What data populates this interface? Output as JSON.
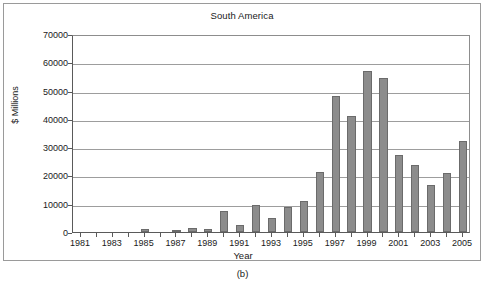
{
  "figure": {
    "caption": "(b)"
  },
  "chart_data": {
    "type": "bar",
    "title": "South America",
    "xlabel": "Year",
    "ylabel": "$ Millions",
    "ylim": [
      0,
      70000
    ],
    "ytick_labels": [
      "0",
      "10000",
      "20000",
      "30000",
      "40000",
      "50000",
      "60000",
      "70000"
    ],
    "yticks": [
      0,
      10000,
      20000,
      30000,
      40000,
      50000,
      60000,
      70000
    ],
    "xtick_labels": [
      "1981",
      "1983",
      "1985",
      "1987",
      "1989",
      "1991",
      "1993",
      "1995",
      "1997",
      "1999",
      "2001",
      "2003",
      "2005"
    ],
    "grid": true,
    "legend": "none",
    "bar_color": "#8c8c8c",
    "bar_edge_color": "#6b6b6b",
    "categories": [
      1981,
      1982,
      1983,
      1984,
      1985,
      1986,
      1987,
      1988,
      1989,
      1990,
      1991,
      1992,
      1993,
      1994,
      1995,
      1996,
      1997,
      1998,
      1999,
      2000,
      2001,
      2002,
      2003,
      2004,
      2005
    ],
    "values": [
      0,
      0,
      0,
      0,
      900,
      0,
      350,
      1300,
      900,
      7500,
      2400,
      9500,
      4900,
      8900,
      10900,
      21300,
      48100,
      40900,
      57100,
      54500,
      27300,
      23700,
      16700,
      20800,
      32300
    ]
  }
}
